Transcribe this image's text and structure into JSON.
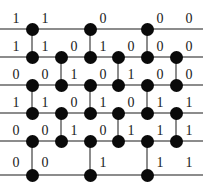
{
  "figure": {
    "name": "binary-lattice-diagram",
    "width": 203,
    "height": 194,
    "background_color": "#ffffff",
    "node_color": "#0a0a0a",
    "line_color": "#8c8c8c",
    "label_color": "#1a1a1a"
  },
  "geometry": {
    "columns_x": [
      32,
      61,
      90,
      118,
      147,
      176
    ],
    "rows_y": [
      29,
      57,
      85,
      113,
      141,
      175
    ],
    "node_radius": 6.5,
    "line_left": 0,
    "line_right": 203
  },
  "rows": [
    {
      "index": 1,
      "y": 29,
      "node_columns": [
        0,
        2,
        4
      ],
      "labels": [
        {
          "text": "1",
          "x": 16,
          "y": 12
        },
        {
          "text": "1",
          "x": 45,
          "y": 12
        },
        {
          "text": "0",
          "x": 103,
          "y": 12
        },
        {
          "text": "0",
          "x": 160,
          "y": 12
        },
        {
          "text": "0",
          "x": 189,
          "y": 12
        }
      ]
    },
    {
      "index": 2,
      "y": 57,
      "node_columns": [
        0,
        1,
        2,
        3,
        4,
        5
      ],
      "labels": [
        {
          "text": "1",
          "x": 16,
          "y": 40
        },
        {
          "text": "1",
          "x": 45,
          "y": 40
        },
        {
          "text": "0",
          "x": 74,
          "y": 40
        },
        {
          "text": "1",
          "x": 103,
          "y": 40
        },
        {
          "text": "0",
          "x": 131,
          "y": 40
        },
        {
          "text": "0",
          "x": 160,
          "y": 40
        },
        {
          "text": "0",
          "x": 189,
          "y": 40
        }
      ]
    },
    {
      "index": 3,
      "y": 85,
      "node_columns": [
        0,
        1,
        2,
        3,
        4,
        5
      ],
      "labels": [
        {
          "text": "0",
          "x": 16,
          "y": 68
        },
        {
          "text": "0",
          "x": 45,
          "y": 68
        },
        {
          "text": "1",
          "x": 74,
          "y": 68
        },
        {
          "text": "0",
          "x": 103,
          "y": 68
        },
        {
          "text": "1",
          "x": 131,
          "y": 68
        },
        {
          "text": "0",
          "x": 160,
          "y": 68
        },
        {
          "text": "0",
          "x": 189,
          "y": 68
        }
      ]
    },
    {
      "index": 4,
      "y": 113,
      "node_columns": [
        0,
        1,
        2,
        3,
        4,
        5
      ],
      "labels": [
        {
          "text": "1",
          "x": 16,
          "y": 96
        },
        {
          "text": "1",
          "x": 45,
          "y": 96
        },
        {
          "text": "0",
          "x": 74,
          "y": 96
        },
        {
          "text": "1",
          "x": 103,
          "y": 96
        },
        {
          "text": "0",
          "x": 131,
          "y": 96
        },
        {
          "text": "1",
          "x": 160,
          "y": 96
        },
        {
          "text": "1",
          "x": 189,
          "y": 96
        }
      ]
    },
    {
      "index": 5,
      "y": 141,
      "node_columns": [
        0,
        1,
        2,
        3,
        4,
        5
      ],
      "labels": [
        {
          "text": "0",
          "x": 16,
          "y": 124
        },
        {
          "text": "0",
          "x": 45,
          "y": 124
        },
        {
          "text": "1",
          "x": 74,
          "y": 124
        },
        {
          "text": "0",
          "x": 103,
          "y": 124
        },
        {
          "text": "1",
          "x": 131,
          "y": 124
        },
        {
          "text": "1",
          "x": 160,
          "y": 124
        },
        {
          "text": "1",
          "x": 189,
          "y": 124
        }
      ]
    },
    {
      "index": 6,
      "y": 175,
      "node_columns": [
        0,
        2,
        4
      ],
      "labels": [
        {
          "text": "0",
          "x": 16,
          "y": 156
        },
        {
          "text": "0",
          "x": 45,
          "y": 156
        },
        {
          "text": "1",
          "x": 103,
          "y": 156
        },
        {
          "text": "1",
          "x": 160,
          "y": 156
        },
        {
          "text": "1",
          "x": 189,
          "y": 156
        }
      ]
    }
  ],
  "vertical_edges": [
    {
      "from_row": 1,
      "to_row": 2,
      "columns": [
        0,
        2,
        4
      ]
    },
    {
      "from_row": 2,
      "to_row": 3,
      "columns": [
        1,
        3,
        5
      ]
    },
    {
      "from_row": 3,
      "to_row": 4,
      "columns": [
        0,
        2,
        4
      ]
    },
    {
      "from_row": 4,
      "to_row": 5,
      "columns": [
        1,
        3,
        5
      ]
    },
    {
      "from_row": 5,
      "to_row": 6,
      "columns": [
        0,
        2,
        4
      ]
    }
  ]
}
